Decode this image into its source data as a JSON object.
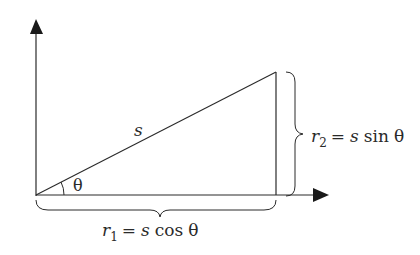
{
  "diagram": {
    "type": "vector-decomposition",
    "colors": {
      "stroke": "#2a2a2a",
      "background": "#ffffff"
    },
    "hypotenuse_label": "s",
    "angle_label": "θ",
    "vertical_component": {
      "var": "r",
      "sub": "2",
      "rhs_s": "s",
      "rhs_func": "sin",
      "rhs_angle": "θ",
      "eq": "="
    },
    "horizontal_component": {
      "var": "r",
      "sub": "1",
      "rhs_s": "s",
      "rhs_func": "cos",
      "rhs_angle": "θ",
      "eq": "="
    }
  }
}
